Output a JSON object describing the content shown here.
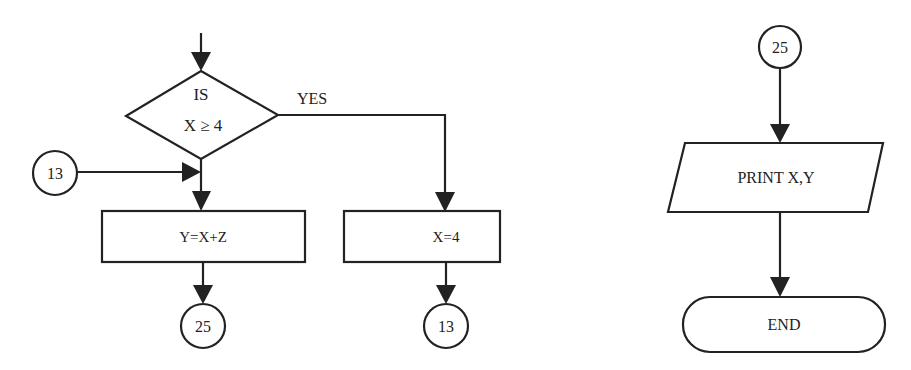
{
  "diagram": {
    "type": "flowchart",
    "colors": {
      "line": "#222222",
      "background": "#ffffff"
    },
    "nodes": [
      {
        "id": "decision",
        "shape": "diamond",
        "label_line1": "IS",
        "label_line2": "X ≥ 4"
      },
      {
        "id": "connector_in_13",
        "shape": "circle",
        "label": "13"
      },
      {
        "id": "process_y",
        "shape": "rectangle",
        "label": "Y=X+Z"
      },
      {
        "id": "connector_out_25",
        "shape": "circle",
        "label": "25"
      },
      {
        "id": "process_x",
        "shape": "rectangle",
        "label": "X=4"
      },
      {
        "id": "connector_out_13",
        "shape": "circle",
        "label": "13"
      },
      {
        "id": "connector_in_25",
        "shape": "circle",
        "label": "25"
      },
      {
        "id": "output_print",
        "shape": "parallelogram",
        "label": "PRINT X,Y"
      },
      {
        "id": "terminator_end",
        "shape": "terminator",
        "label": "END"
      }
    ],
    "edges": [
      {
        "from": "entry",
        "to": "decision",
        "label": ""
      },
      {
        "from": "decision",
        "to": "process_x",
        "label": "YES"
      },
      {
        "from": "decision",
        "to": "process_y",
        "label": ""
      },
      {
        "from": "connector_in_13",
        "to": "process_y",
        "label": ""
      },
      {
        "from": "process_y",
        "to": "connector_out_25",
        "label": ""
      },
      {
        "from": "process_x",
        "to": "connector_out_13",
        "label": ""
      },
      {
        "from": "connector_in_25",
        "to": "output_print",
        "label": ""
      },
      {
        "from": "output_print",
        "to": "terminator_end",
        "label": ""
      }
    ],
    "labels": {
      "decision_l1": "IS",
      "decision_l2": "X ≥ 4",
      "yes": "YES",
      "conn_in_13": "13",
      "proc_y": "Y=X+Z",
      "conn_out_25": "25",
      "proc_x": "X=4",
      "conn_out_13": "13",
      "conn_in_25": "25",
      "print": "PRINT X,Y",
      "end": "END"
    }
  }
}
